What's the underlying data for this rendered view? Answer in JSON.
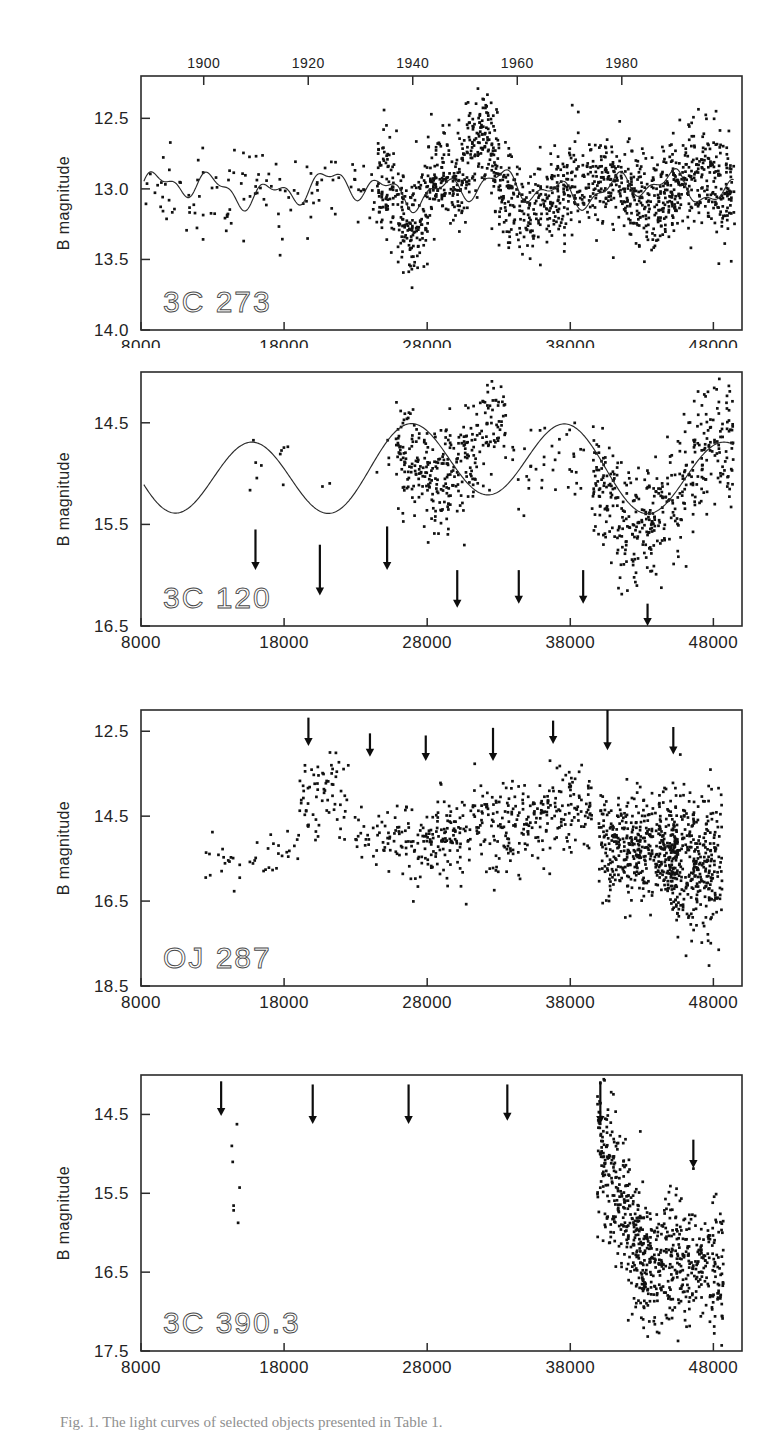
{
  "figure": {
    "xaxis_title": "J.D.   2400000  +",
    "yaxis_title": "B magnitude",
    "caption": "Fig. 1.    The light curves of selected objects presented in Table 1.",
    "top_axis_label": "year"
  },
  "chart_data": [
    {
      "type": "scatter",
      "title": "3C 273",
      "panel_index": 0,
      "xlabel": "J.D. 2400000 +",
      "ylabel": "B magnitude",
      "xlim": [
        8000,
        50000
      ],
      "ylim": [
        14.0,
        12.2
      ],
      "y_inverted": true,
      "xticks": [
        8000,
        18000,
        28000,
        38000,
        48000
      ],
      "xticklabels": [
        "8000",
        "18000",
        "28000",
        "38000",
        "48000"
      ],
      "yticks": [
        12.5,
        13.0,
        13.5,
        14.0
      ],
      "yticklabels": [
        "12.5",
        "13.0",
        "13.5",
        "14.0"
      ],
      "top_axis": {
        "ticks": [
          1900,
          1920,
          1940,
          1960,
          1980
        ],
        "labels": [
          "1900",
          "1920",
          "1940",
          "1960",
          "1980"
        ],
        "range": [
          1888,
          2003
        ]
      },
      "has_fit_curve": true,
      "fit_curve_note": "sinusoidal/periodic model overlaid on data",
      "arrows": [],
      "n_points_approx": 1100,
      "grid": false,
      "legend": "none"
    },
    {
      "type": "scatter",
      "title": "3C 120",
      "panel_index": 1,
      "xlabel": "J.D. 2400000 +",
      "ylabel": "B magnitude",
      "xlim": [
        8000,
        50000
      ],
      "ylim": [
        16.5,
        14.0
      ],
      "y_inverted": true,
      "xticks": [
        8000,
        18000,
        28000,
        38000,
        48000
      ],
      "xticklabels": [
        "8000",
        "18000",
        "28000",
        "38000",
        "48000"
      ],
      "yticks": [
        14.5,
        15.5,
        16.5
      ],
      "yticklabels": [
        "14.5",
        "15.5",
        "16.5"
      ],
      "has_fit_curve": true,
      "fit_curve_note": "sinusoidal/periodic model overlaid on data",
      "arrows": [
        {
          "x": 16000,
          "y_top": 15.55,
          "y_bot": 15.95
        },
        {
          "x": 20500,
          "y_top": 15.7,
          "y_bot": 16.2
        },
        {
          "x": 25200,
          "y_top": 15.52,
          "y_bot": 15.95
        },
        {
          "x": 30100,
          "y_top": 15.95,
          "y_bot": 16.32
        },
        {
          "x": 34400,
          "y_top": 15.95,
          "y_bot": 16.28
        },
        {
          "x": 38900,
          "y_top": 15.95,
          "y_bot": 16.28
        },
        {
          "x": 43400,
          "y_top": 16.28,
          "y_bot": 16.5
        }
      ],
      "n_points_approx": 700,
      "grid": false,
      "legend": "none"
    },
    {
      "type": "scatter",
      "title": "OJ 287",
      "panel_index": 2,
      "xlabel": "J.D. 2400000 +",
      "ylabel": "B magnitude",
      "xlim": [
        8000,
        50000
      ],
      "ylim": [
        18.5,
        12.0
      ],
      "y_inverted": true,
      "xticks": [
        8000,
        18000,
        28000,
        38000,
        48000
      ],
      "xticklabels": [
        "8000",
        "18000",
        "28000",
        "38000",
        "48000"
      ],
      "yticks": [
        12.5,
        14.5,
        16.5,
        18.5
      ],
      "yticklabels": [
        "12.5",
        "14.5",
        "16.5",
        "18.5"
      ],
      "has_fit_curve": false,
      "arrows": [
        {
          "x": 19700,
          "y_top": 12.18,
          "y_bot": 12.85
        },
        {
          "x": 24000,
          "y_top": 12.55,
          "y_bot": 13.1
        },
        {
          "x": 27900,
          "y_top": 12.6,
          "y_bot": 13.2
        },
        {
          "x": 32600,
          "y_top": 12.42,
          "y_bot": 13.2
        },
        {
          "x": 36800,
          "y_top": 12.25,
          "y_bot": 12.8
        },
        {
          "x": 40600,
          "y_top": 12.0,
          "y_bot": 12.95
        },
        {
          "x": 45200,
          "y_top": 12.4,
          "y_bot": 13.05
        }
      ],
      "n_points_approx": 900,
      "grid": false,
      "legend": "none"
    },
    {
      "type": "scatter",
      "title": "3C 390.3",
      "panel_index": 3,
      "xlabel": "J.D. 2400000 +",
      "ylabel": "B magnitude",
      "xlim": [
        8000,
        50000
      ],
      "ylim": [
        17.5,
        14.0
      ],
      "y_inverted": true,
      "xticks": [
        8000,
        18000,
        28000,
        38000,
        48000
      ],
      "xticklabels": [
        "8000",
        "18000",
        "28000",
        "38000",
        "48000"
      ],
      "yticks": [
        14.5,
        15.5,
        16.5,
        17.5
      ],
      "yticklabels": [
        "14.5",
        "15.5",
        "16.5",
        "17.5"
      ],
      "has_fit_curve": false,
      "arrows": [
        {
          "x": 13600,
          "y_top": 14.08,
          "y_bot": 14.52
        },
        {
          "x": 20000,
          "y_top": 14.12,
          "y_bot": 14.62
        },
        {
          "x": 26700,
          "y_top": 14.12,
          "y_bot": 14.62
        },
        {
          "x": 33600,
          "y_top": 14.12,
          "y_bot": 14.58
        },
        {
          "x": 40100,
          "y_top": 14.08,
          "y_bot": 14.62
        },
        {
          "x": 46600,
          "y_top": 14.82,
          "y_bot": 15.18
        }
      ],
      "n_points_approx": 700,
      "grid": false,
      "legend": "none"
    }
  ]
}
